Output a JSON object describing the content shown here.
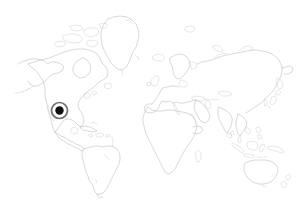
{
  "figure": {
    "type": "world-map",
    "projection": "equirectangular",
    "width": 305,
    "height": 210,
    "background_color": "#ffffff",
    "coastline_color": "#b9b9bd",
    "coastline_faint_color": "#cfcfd4",
    "has_graticule": false,
    "has_labels": false,
    "has_legend": false,
    "has_border": false
  },
  "marker": {
    "name": "location-marker",
    "shape": "ringed-dot",
    "center_x": 59.5,
    "center_y": 110.5,
    "outer_ring_radius": 8.0,
    "inner_dot_radius": 4.2,
    "ring_color": "#6f6f74",
    "gap_color": "#ffffff",
    "dot_color": "#101014",
    "region_label": "Eastern Pacific off southwestern Mexico / Central America"
  },
  "landmasses": [
    {
      "id": "north-america",
      "label": "North America"
    },
    {
      "id": "greenland",
      "label": "Greenland"
    },
    {
      "id": "central-america",
      "label": "Central America"
    },
    {
      "id": "caribbean",
      "label": "Caribbean Islands"
    },
    {
      "id": "south-america",
      "label": "South America"
    },
    {
      "id": "europe",
      "label": "Europe"
    },
    {
      "id": "scandinavia",
      "label": "Scandinavia"
    },
    {
      "id": "british-isles",
      "label": "British Isles"
    },
    {
      "id": "iceland",
      "label": "Iceland"
    },
    {
      "id": "africa",
      "label": "Africa"
    },
    {
      "id": "madagascar",
      "label": "Madagascar"
    },
    {
      "id": "asia",
      "label": "Asia"
    },
    {
      "id": "arabia",
      "label": "Arabian Peninsula"
    },
    {
      "id": "india",
      "label": "Indian Subcontinent"
    },
    {
      "id": "southeast-asia",
      "label": "Southeast Asia"
    },
    {
      "id": "japan",
      "label": "Japan"
    },
    {
      "id": "indonesia",
      "label": "Indonesian Archipelago"
    },
    {
      "id": "philippines",
      "label": "Philippines"
    },
    {
      "id": "new-guinea",
      "label": "New Guinea"
    },
    {
      "id": "australia",
      "label": "Australia"
    },
    {
      "id": "new-zealand",
      "label": "New Zealand"
    },
    {
      "id": "sri-lanka",
      "label": "Sri Lanka"
    },
    {
      "id": "svalbard",
      "label": "Svalbard"
    },
    {
      "id": "novaya-zemlya",
      "label": "Novaya Zemlya"
    }
  ],
  "accessibility": {
    "caption": "Outline world map, light gray coastlines on white background, with one dark ringed dot marker placed in the eastern Pacific Ocean near southwestern Mexico."
  }
}
